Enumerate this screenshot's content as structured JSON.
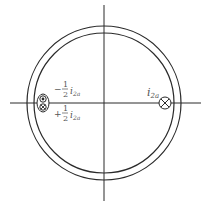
{
  "diagram": {
    "type": "machine-cross-section",
    "colors": {
      "line": "#2a2a2a",
      "text": "#555555",
      "background": "#ffffff"
    },
    "conductors": [
      {
        "id": "right",
        "symbol": "cross",
        "label_var": "i",
        "label_sub": "2a"
      },
      {
        "id": "left-top",
        "symbol": "dot",
        "sign": "−",
        "fraction": [
          "1",
          "2"
        ],
        "label_var": "i",
        "label_sub": "2a"
      },
      {
        "id": "left-bottom",
        "symbol": "cross",
        "sign": "+",
        "fraction": [
          "1",
          "2"
        ],
        "label_var": "i",
        "label_sub": "2a"
      }
    ]
  }
}
